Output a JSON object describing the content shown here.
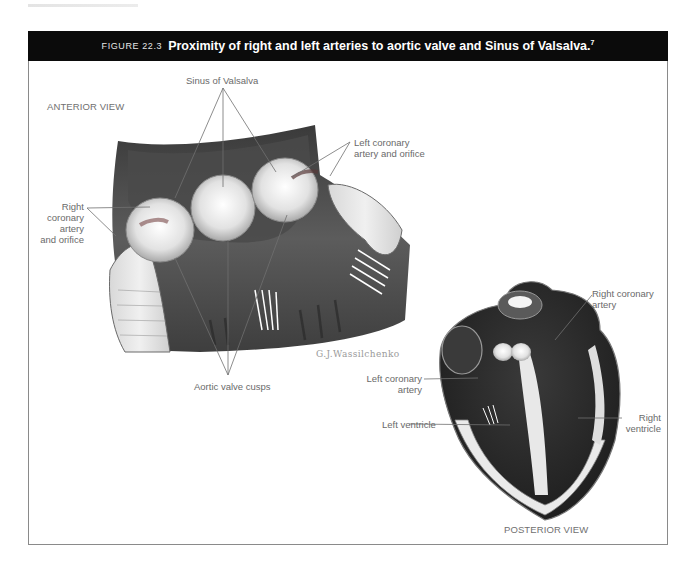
{
  "page": {
    "running_header": ""
  },
  "figure": {
    "number": "FIGURE 22.3",
    "title": "Proximity of right and left arteries to aortic valve and Sinus of Valsalva.",
    "footnote_ref": "7",
    "colors": {
      "header_bg": "#0b0b0b",
      "header_text": "#ffffff",
      "frame": "#8a8a8a",
      "label_text": "#6a6a6a",
      "leader_line": "#707070"
    }
  },
  "anterior_view": {
    "view_label": "ANTERIOR VIEW",
    "labels": {
      "sinus": "Sinus of Valsalva",
      "left_coronary_line1": "Left coronary",
      "left_coronary_line2": "artery and orifice",
      "right_coronary_line1": "Right",
      "right_coronary_line2": "coronary",
      "right_coronary_line3": "artery",
      "right_coronary_line4": "and orifice",
      "aortic_cusps": "Aortic valve cusps"
    },
    "signature": "G.J.Wassilchenko"
  },
  "posterior_view": {
    "view_label": "POSTERIOR VIEW",
    "labels": {
      "right_coronary_line1": "Right coronary",
      "right_coronary_line2": "artery",
      "left_coronary_line1": "Left coronary",
      "left_coronary_line2": "artery",
      "left_ventricle": "Left ventricle",
      "right_ventricle_line1": "Right",
      "right_ventricle_line2": "ventricle"
    }
  }
}
